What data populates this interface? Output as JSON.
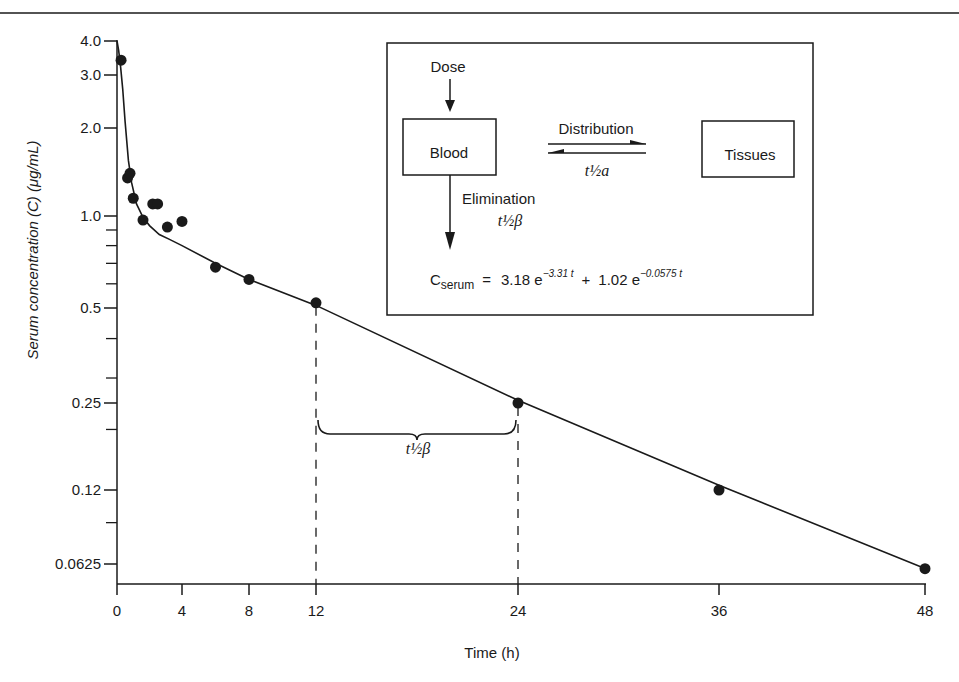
{
  "chart_data": {
    "type": "scatter",
    "title": "",
    "xlabel": "Time (h)",
    "ylabel": "Serum concentration (C) (μg/mL)",
    "yscale": "log",
    "xlim": [
      0,
      48
    ],
    "ylim": [
      0.0625,
      4.0
    ],
    "grid": false,
    "x_ticks": [
      0,
      4,
      8,
      12,
      24,
      36,
      48
    ],
    "x_tick_labels": [
      "0",
      "4",
      "8",
      "12",
      "24",
      "36",
      "48"
    ],
    "y_ticks": [
      4.0,
      3.0,
      2.0,
      1.0,
      0.5,
      0.25,
      0.12,
      0.0625
    ],
    "y_tick_labels": [
      "4.0",
      "3.0",
      "2.0",
      "1.0",
      "0.5",
      "0.25",
      "0.12",
      "0.0625"
    ],
    "y_minor_ticks": [
      0.9,
      0.8,
      0.7,
      0.6,
      0.4,
      0.3,
      0.2,
      0.09
    ],
    "series": [
      {
        "name": "Observed serum concentration",
        "kind": "scatter",
        "x": [
          0.25,
          0.65,
          0.8,
          1.0,
          1.6,
          2.2,
          2.5,
          3.1,
          4.0,
          6.0,
          8.0,
          12.0,
          24.0,
          36.0,
          48.0
        ],
        "y": [
          3.4,
          1.35,
          1.4,
          1.15,
          0.97,
          1.1,
          1.1,
          0.92,
          0.96,
          0.68,
          0.62,
          0.52,
          0.25,
          0.12,
          0.06
        ]
      },
      {
        "name": "Biexponential fit",
        "kind": "line",
        "equation": "C = 3.18 e^(-3.31 t) + 1.02 e^(-0.0575 t)",
        "x": [
          0,
          0.1,
          0.2,
          0.35,
          0.5,
          0.7,
          0.9,
          1.2,
          1.6,
          2.0,
          2.6,
          3.2,
          4.0,
          6.0,
          8.0,
          12.0,
          24.0,
          36.0,
          48.0
        ],
        "y": [
          4.0,
          3.7,
          3.3,
          2.7,
          2.1,
          1.55,
          1.3,
          1.1,
          0.99,
          0.93,
          0.87,
          0.84,
          0.8,
          0.7,
          0.62,
          0.51,
          0.255,
          0.125,
          0.06
        ]
      }
    ],
    "annotations": [
      {
        "type": "dashed-line",
        "x": 12,
        "from_y": 0.52,
        "to_y": 0.0625
      },
      {
        "type": "dashed-line",
        "x": 24,
        "from_y": 0.25,
        "to_y": 0.0625
      },
      {
        "type": "brace",
        "x_from": 12,
        "x_to": 24,
        "label": "t½β"
      }
    ]
  },
  "inset": {
    "dose_label": "Dose",
    "blood_label": "Blood",
    "tissues_label": "Tissues",
    "distribution_label": "Distribution",
    "distribution_halflife": "t½a",
    "elimination_label": "Elimination",
    "elimination_halflife": "t½β",
    "equation": {
      "lhs": "C",
      "lhs_sub": "serum",
      "eq": "=",
      "term1_coef": "3.18 e",
      "term1_exp": "−3.31 t",
      "plus": "+",
      "term2_coef": "1.02 e",
      "term2_exp": "−0.0575 t"
    }
  },
  "brace_label": "t½β",
  "colors": {
    "ink": "#1a1a1a",
    "background": "#ffffff"
  }
}
